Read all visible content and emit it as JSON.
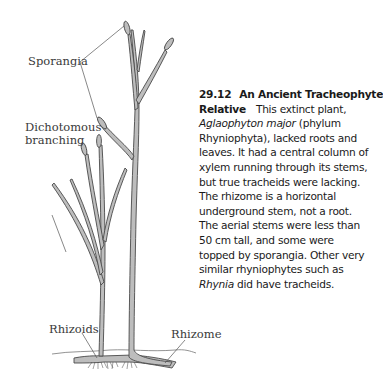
{
  "figure": {
    "labels": {
      "sporangia": "Sporangia",
      "dichotomous_line1": "Dichotomous",
      "dichotomous_line2": "branching",
      "rhizoids": "Rhizoids",
      "rhizome": "Rhizome"
    },
    "caption": {
      "number": "29.12",
      "title_line1": "An Ancient Tracheophyte",
      "title_line2": "Relative",
      "lines": [
        "This extinct plant,",
        "Aglaophyton major",
        " (phylum",
        "Rhyniophyta), lacked roots and",
        "leaves. It had a central column of",
        "xylem running through its stems,",
        "but true tracheids were lacking.",
        "The rhizome is a horizontal",
        "underground stem, not a root.",
        "The aerial stems were less than",
        "50 cm tall, and some were",
        "topped by sporangia. Other very",
        "similar rhyniophytes such as",
        "Rhynia",
        " did have tracheids."
      ]
    },
    "colors": {
      "stem_fill": "#b9b9b9",
      "stem_outline": "#4a4a4a",
      "leader_line": "#555555",
      "text": "#1a1a1a"
    }
  }
}
